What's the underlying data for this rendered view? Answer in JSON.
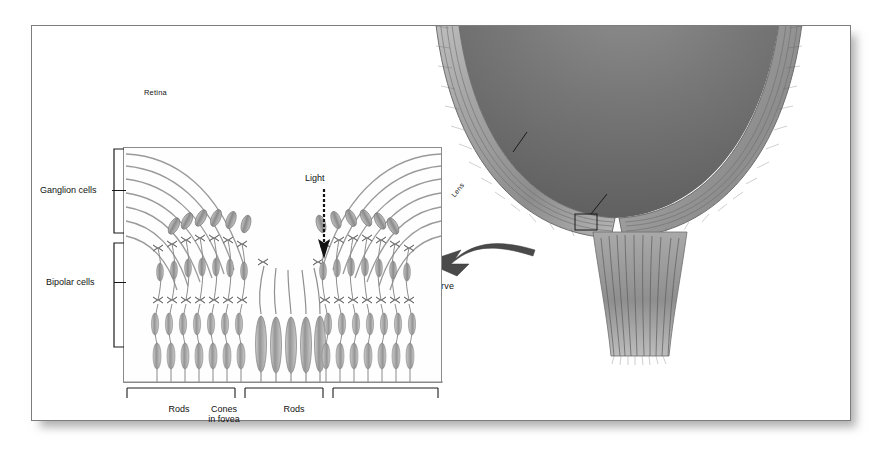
{
  "figure": {
    "background_color": "#ffffff",
    "frame_color": "#7d7d7d"
  },
  "eye_diagram": {
    "labels": {
      "retina": "Retina",
      "fovea": "Fovea",
      "optic_disk": "Optic disk",
      "lens": "Lens",
      "optic_nerve": "Optic nerve"
    }
  },
  "retina_inset": {
    "light_label": "Light",
    "side_labels": {
      "ganglion": "Ganglion cells",
      "bipolar": "Bipolar cells"
    },
    "bottom_labels": {
      "rods_left": "Rods",
      "cones": "Cones",
      "cones_line2": "in fovea",
      "rods_right": "Rods"
    }
  }
}
